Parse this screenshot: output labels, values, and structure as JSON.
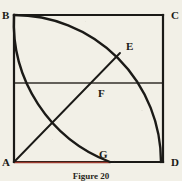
{
  "figure": {
    "caption": "Figure 20",
    "background_color": "#f2f0e7",
    "ink_color": "#1b1a17",
    "accent_color": "#9c3a2e",
    "labels": {
      "A": "A",
      "B": "B",
      "C": "C",
      "D": "D",
      "E": "E",
      "F": "F",
      "G": "G"
    },
    "vertices": {
      "A": {
        "x": 14,
        "y": 162
      },
      "B": {
        "x": 14,
        "y": 15
      },
      "C": {
        "x": 163,
        "y": 15
      },
      "D": {
        "x": 163,
        "y": 162
      },
      "E": {
        "x": 119,
        "y": 54
      },
      "F": {
        "x": 92,
        "y": 83
      },
      "G": {
        "x": 110,
        "y": 162
      }
    },
    "elements": [
      {
        "name": "square-side-ab",
        "type": "line",
        "from": "A",
        "to": "B"
      },
      {
        "name": "square-side-bc",
        "type": "line",
        "from": "B",
        "to": "C"
      },
      {
        "name": "square-side-cd",
        "type": "line",
        "from": "C",
        "to": "D"
      },
      {
        "name": "square-side-da",
        "type": "line",
        "from": "D",
        "to": "A"
      },
      {
        "name": "midline-horizontal",
        "type": "line",
        "from": "left-mid",
        "to": "right-mid"
      },
      {
        "name": "diagonal-a-to-e",
        "type": "line",
        "from": "A",
        "to": "E"
      },
      {
        "name": "arc-b-to-d",
        "type": "arc",
        "center": "A",
        "from": "B",
        "to": "D"
      },
      {
        "name": "arc-b-to-g",
        "type": "arc",
        "center": "C",
        "from": "B",
        "to": "G"
      },
      {
        "name": "segment-a-to-g",
        "type": "line",
        "from": "A",
        "to": "G",
        "color": "accent"
      }
    ]
  }
}
